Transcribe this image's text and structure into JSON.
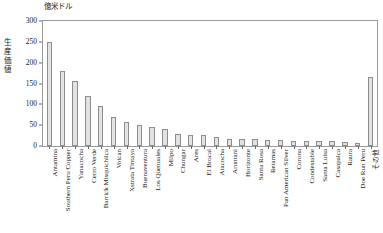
{
  "chart_data": {
    "type": "bar",
    "title": "",
    "subtitle": "",
    "unit_label": "億米ドル",
    "ylabel": "生産価値",
    "xlabel": "",
    "ylim": [
      0,
      300
    ],
    "ytick_step": 50,
    "yticks": [
      "0",
      "50",
      "100",
      "150",
      "200",
      "250",
      "300"
    ],
    "grid": false,
    "legend": "none",
    "categories": [
      "Antamina",
      "Southern Peru Copper",
      "Yanacocha",
      "Cerro Verde",
      "Barrick Misquichilca",
      "Volcan",
      "Xstrata Tintaya",
      "Buenaventura",
      "Los Quenuales",
      "Milpo",
      "Chungar",
      "Ares",
      "El Brocal",
      "Atacocha",
      "Aruntani",
      "Horizonte",
      "Santa Rosa",
      "Retamas",
      "Pan American Silver",
      "Corona",
      "Condestable",
      "Santa Luisa",
      "Casapalca",
      "Raura",
      "Doe Run Peru",
      "その他"
    ],
    "values": [
      250,
      180,
      155,
      120,
      97,
      70,
      58,
      50,
      45,
      42,
      28,
      26,
      26,
      22,
      17,
      16,
      16,
      14,
      14,
      13,
      12,
      11,
      11,
      10,
      8,
      165
    ],
    "bar_fill": "#e2e2e2",
    "bar_stroke": "#8d8d8d",
    "axis_color": "#9a9a9a"
  }
}
